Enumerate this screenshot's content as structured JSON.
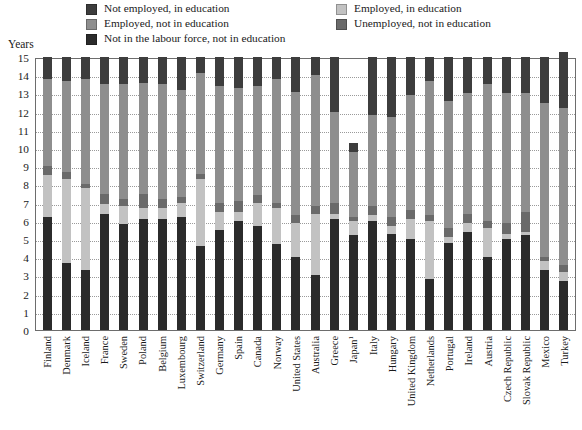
{
  "legend": {
    "left_items": [
      {
        "label": "Not employed, in education",
        "color": "#3d3d3d",
        "key": "not_employed_in_education"
      },
      {
        "label": "Employed, not in education",
        "color": "#8e8e8e",
        "key": "employed_not_in_education"
      },
      {
        "label": "Not in the labour force, not in education",
        "color": "#2b2b2b",
        "key": "not_in_labour_force_not_in_education"
      }
    ],
    "right_items": [
      {
        "label": "Employed, in education",
        "color": "#c2c2c2",
        "key": "employed_in_education"
      },
      {
        "label": "Unemployed, not in education",
        "color": "#6a6a6a",
        "key": "unemployed_not_in_education"
      }
    ]
  },
  "axis": {
    "y_title": "Years",
    "y_ticks": [
      "15",
      "14",
      "13",
      "12",
      "11",
      "10",
      "9",
      "8",
      "7",
      "6",
      "5",
      "4",
      "3",
      "2",
      "1",
      "0"
    ]
  },
  "chart_data": {
    "type": "bar",
    "title": "",
    "xlabel": "",
    "ylabel": "Years",
    "ylim": [
      0,
      15
    ],
    "grid": true,
    "stacked": true,
    "legend_position": "top",
    "categories": [
      "Finland",
      "Denmark",
      "Iceland",
      "France",
      "Sweden",
      "Poland",
      "Belgium",
      "Luxembourg",
      "Switzerland",
      "Germany",
      "Spain",
      "Canada",
      "Norway",
      "United States",
      "Australia",
      "Greece",
      "Japan¹",
      "Italy",
      "Hungary",
      "United Kingdom",
      "Netherlands",
      "Portugal",
      "Ireland",
      "Austria",
      "Czech Republic",
      "Slovak Republic",
      "Mexico",
      "Turkey"
    ],
    "series": [
      {
        "name": "Not in the labour force, not in education",
        "color": "#2b2b2b",
        "values": [
          6.2,
          3.7,
          3.3,
          6.4,
          5.8,
          6.1,
          6.1,
          6.2,
          4.6,
          5.5,
          6.0,
          5.7,
          4.7,
          4.0,
          3.0,
          6.1,
          5.2,
          6.0,
          5.3,
          5.0,
          2.8,
          4.8,
          5.4,
          4.0,
          5.0,
          5.2,
          3.3,
          2.7
        ]
      },
      {
        "name": "Employed, in education",
        "color": "#c2c2c2",
        "values": [
          2.3,
          4.6,
          4.5,
          0.5,
          1.0,
          0.6,
          0.6,
          0.8,
          3.7,
          1.0,
          0.5,
          1.3,
          2.0,
          1.9,
          3.4,
          0.3,
          0.8,
          0.3,
          0.4,
          1.1,
          3.2,
          0.3,
          0.5,
          1.6,
          0.3,
          0.2,
          0.5,
          0.5
        ]
      },
      {
        "name": "Unemployed, not in education",
        "color": "#6a6a6a",
        "values": [
          0.5,
          0.4,
          0.2,
          0.6,
          0.4,
          0.8,
          0.5,
          0.3,
          0.3,
          0.5,
          0.6,
          0.4,
          0.3,
          0.4,
          0.4,
          0.6,
          0.2,
          0.5,
          0.5,
          0.5,
          0.3,
          0.5,
          0.5,
          0.4,
          0.6,
          1.1,
          0.2,
          0.4
        ]
      },
      {
        "name": "Employed, not in education",
        "color": "#8e8e8e",
        "values": [
          4.8,
          5.0,
          5.8,
          6.0,
          6.3,
          6.1,
          6.3,
          5.9,
          5.5,
          6.4,
          6.2,
          6.0,
          6.8,
          6.8,
          7.2,
          5.0,
          3.6,
          5.0,
          5.5,
          6.3,
          7.4,
          7.0,
          6.6,
          7.5,
          7.1,
          6.5,
          8.5,
          8.6
        ]
      },
      {
        "name": "Not employed, in education",
        "color": "#3d3d3d",
        "values": [
          1.2,
          1.3,
          1.2,
          1.5,
          1.5,
          1.4,
          1.5,
          1.8,
          0.9,
          1.6,
          1.7,
          1.6,
          1.2,
          1.9,
          1.0,
          3.0,
          0.5,
          3.2,
          3.3,
          2.1,
          1.3,
          2.4,
          2.0,
          1.5,
          2.0,
          2.0,
          2.5,
          3.1
        ]
      }
    ]
  }
}
